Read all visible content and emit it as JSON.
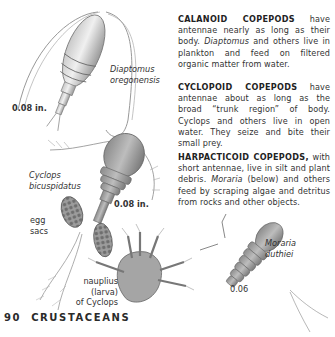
{
  "page": {
    "number": "90",
    "section": "CRUSTACEANS"
  },
  "paragraphs": [
    {
      "heading": "CALANOID COPEPODS",
      "text_1": " have antennae nearly as long as their body. ",
      "italic": "Diaptomus",
      "text_2": " and others live in plankton and feed on filtered organic matter from water."
    },
    {
      "heading": "CYCLOPOID COPEPODS",
      "text_1": " have antennae about as long as the broad “trunk region” of body. Cyclops and others live in open water. They seize and bite their small prey."
    },
    {
      "heading": "HARPACTICOID COPEPODS,",
      "text_1": " with short antennae, live in silt and plant debris. ",
      "italic": "Moraria",
      "text_2": " (below) and others feed by scraping algae and detritus from rocks and other objects."
    }
  ],
  "labels": {
    "diaptomus_name_1": "Diaptomus",
    "diaptomus_name_2": "oregonensis",
    "diaptomus_size": "0.08 in.",
    "cyclops_name_1": "Cyclops",
    "cyclops_name_2": "bicuspidatus",
    "cyclops_size": "0.08 in.",
    "egg_sacs_1": "egg",
    "egg_sacs_2": "sacs",
    "nauplius_1": "nauplius",
    "nauplius_2": "(larva)",
    "nauplius_3": "of Cyclops",
    "moraria_name_1": "Moraria",
    "moraria_name_2": "duthiei",
    "moraria_size": "0.06"
  },
  "colors": {
    "background": "#ffffff",
    "text": "#333333",
    "illustration": "#8a8a8a"
  }
}
